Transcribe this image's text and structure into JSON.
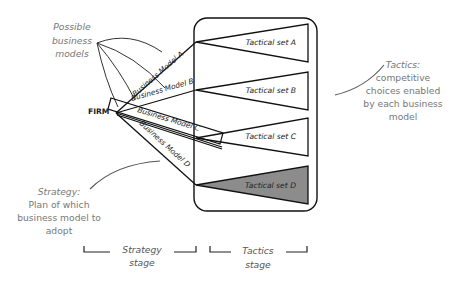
{
  "diagram": {
    "firm_label": "FIRM",
    "possible_models_label": [
      "Possible",
      "business",
      "models"
    ],
    "business_models": [
      {
        "label": "Business Model A"
      },
      {
        "label": "Business Model B"
      },
      {
        "label": "Business Model C",
        "highlighted": true
      },
      {
        "label": "Business Model D"
      }
    ],
    "tactical_sets": [
      {
        "label": "Tactical set A",
        "fill": "#ffffff"
      },
      {
        "label": "Tactical set B",
        "fill": "#ffffff"
      },
      {
        "label": "Tactical set C",
        "fill": "#ffffff"
      },
      {
        "label": "Tactical set D",
        "fill": "#8c8c8c"
      }
    ],
    "tactics_annotation": {
      "title": "Tactics:",
      "lines": [
        "competitive",
        "choices enabled",
        "by each business",
        "model"
      ]
    },
    "strategy_annotation": {
      "title": "Strategy:",
      "lines": [
        "Plan of which",
        "business model to",
        "adopt"
      ]
    },
    "stages": [
      {
        "line1": "Strategy",
        "line2": "stage"
      },
      {
        "line1": "Tactics",
        "line2": "stage"
      }
    ],
    "colors": {
      "line": "#111111",
      "annotation_text": "#777777",
      "annotation_curve": "#555555",
      "highlight_fill": "#8c8c8c"
    }
  }
}
